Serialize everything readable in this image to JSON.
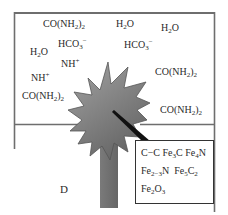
{
  "diagram": {
    "labels": {
      "urea_1": {
        "base": "CO(NH",
        "sub": "2",
        "close": ")",
        "sub2": "2"
      },
      "water_1": {
        "base": "H",
        "sub": "2",
        "tail": "O"
      },
      "water_2": {
        "base": "H",
        "sub": "2",
        "tail": "O"
      },
      "bicarbonate_1": {
        "base": "HCO",
        "sub": "3",
        "sup": "−"
      },
      "water_3": {
        "base": "H",
        "sub": "2",
        "tail": "O"
      },
      "bicarbonate_2": {
        "base": "HCO",
        "sub": "3",
        "sup": "−"
      },
      "ammonium_1": {
        "base": "NH",
        "sup": "+"
      },
      "urea_2": {
        "base": "CO(NH",
        "sub": "2",
        "close": ")",
        "sub2": "2"
      },
      "ammonium_2": {
        "base": "NH",
        "sup": "+"
      },
      "urea_3": {
        "base": "CO(NH",
        "sub": "2",
        "close": ")",
        "sub2": "2"
      },
      "urea_4": {
        "base": "CO(NH",
        "sub": "2",
        "close": ")",
        "sub2": "2"
      }
    },
    "corner_label": "D",
    "callout": {
      "row1": {
        "a": "C−C Fe",
        "a_sub": "3",
        "b": "C Fe",
        "b_sub": "4",
        "c": "N"
      },
      "row2": {
        "a": "Fe",
        "a_sub": "2−3",
        "b": "N  Fe",
        "b_sub": "5",
        "c": "C",
        "c_sub": "2"
      },
      "row3": {
        "a": "Fe",
        "a_sub": "2",
        "b": "O",
        "b_sub": "3"
      }
    },
    "colors": {
      "container_stroke": "#6e6e6e",
      "star_fill_light": "#a0a0a0",
      "star_fill_dark": "#6a6a6a",
      "star_stroke": "#555555",
      "pointer_line": "#111111"
    }
  }
}
